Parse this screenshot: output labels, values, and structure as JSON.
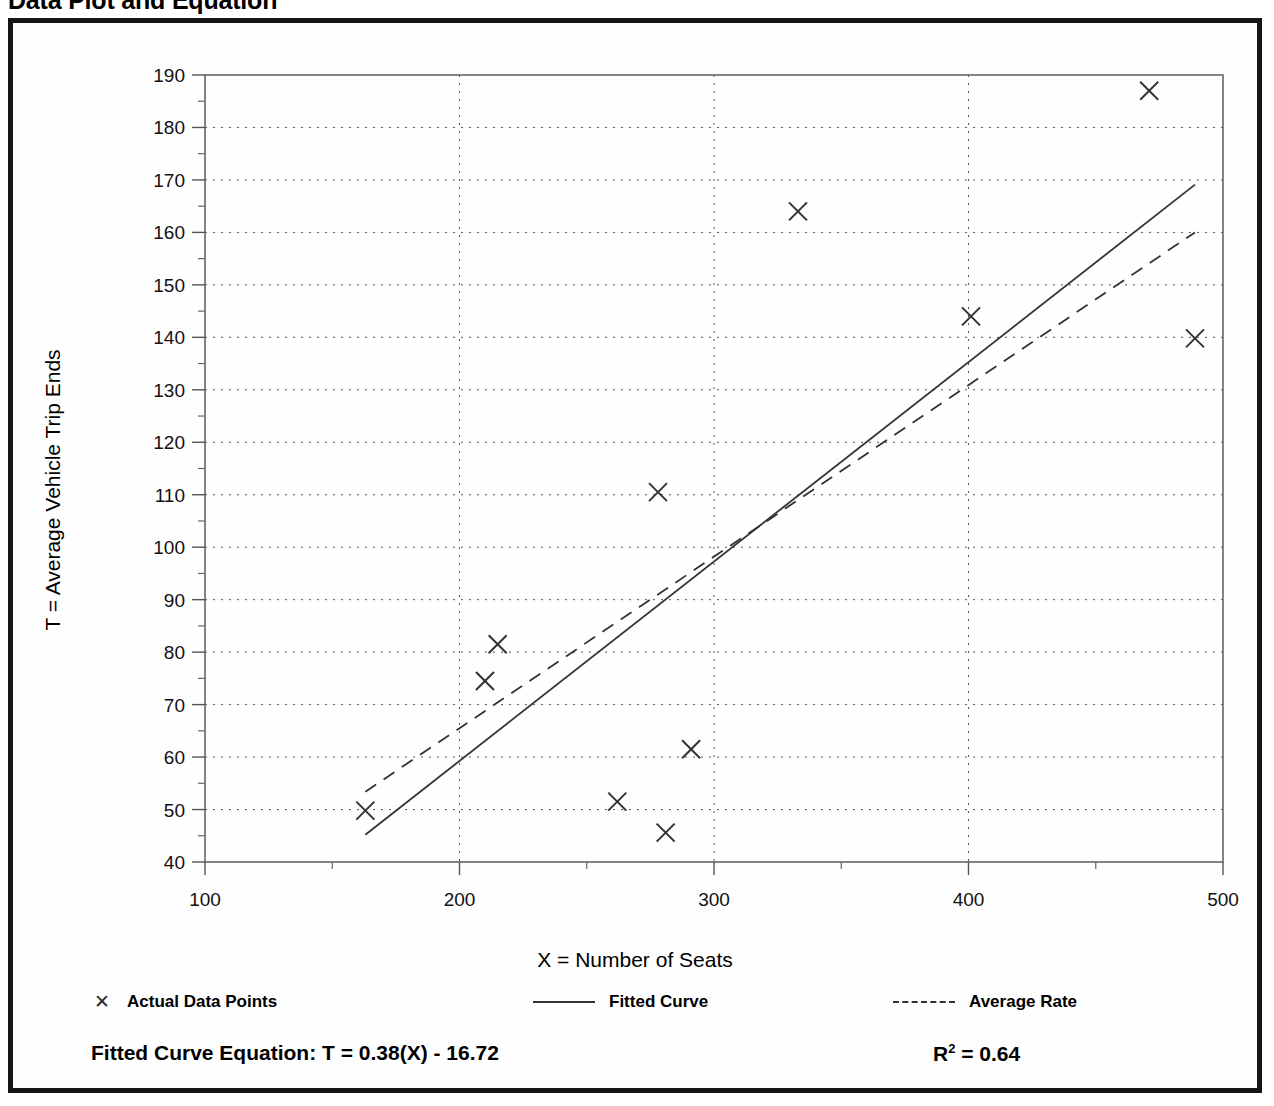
{
  "page": {
    "title": "Data Plot and Equation"
  },
  "legend": {
    "points": {
      "label": "Actual Data Points",
      "marker": "✕"
    },
    "fitted": {
      "label": "Fitted Curve"
    },
    "average": {
      "label": "Average Rate"
    }
  },
  "footer": {
    "equation_label": "Fitted Curve Equation:",
    "equation_value": "T = 0.38(X) - 16.72",
    "equation_full": "Fitted Curve Equation:  T = 0.38(X) - 16.72",
    "r_symbol": "R",
    "r_exponent": "2",
    "r_value": "= 0.64",
    "r_squared_full": "R2 = 0.64"
  },
  "chart_data": {
    "type": "scatter",
    "title": "Data Plot and Equation",
    "xlabel": "X = Number of Seats",
    "ylabel": "T = Average Vehicle Trip Ends",
    "xlim": [
      100,
      500
    ],
    "ylim": [
      40,
      190
    ],
    "xticks": [
      100,
      200,
      300,
      400,
      500
    ],
    "yticks": [
      40,
      50,
      60,
      70,
      80,
      90,
      100,
      110,
      120,
      130,
      140,
      150,
      160,
      170,
      180,
      190
    ],
    "xtick_labels": [
      "100",
      "200",
      "300",
      "400",
      "500"
    ],
    "ytick_labels": [
      "40",
      "50",
      "60",
      "70",
      "80",
      "90",
      "100",
      "110",
      "120",
      "130",
      "140",
      "150",
      "160",
      "170",
      "180",
      "190"
    ],
    "x_minor_step": 50,
    "y_minor_step": 5,
    "grid": true,
    "grid_style": "dotted",
    "legend_position": "below-axes",
    "marker": "x",
    "marker_color": "#333333",
    "points": [
      {
        "x": 163,
        "y": 49.8
      },
      {
        "x": 210,
        "y": 74.5
      },
      {
        "x": 215,
        "y": 81.5
      },
      {
        "x": 262,
        "y": 51.5
      },
      {
        "x": 278,
        "y": 110.5
      },
      {
        "x": 281,
        "y": 45.6
      },
      {
        "x": 291,
        "y": 61.5
      },
      {
        "x": 333,
        "y": 164.0
      },
      {
        "x": 401,
        "y": 144.0
      },
      {
        "x": 471,
        "y": 187.0
      },
      {
        "x": 489,
        "y": 139.8
      }
    ],
    "series": [
      {
        "name": "Fitted Curve",
        "type": "line",
        "style": "solid",
        "color": "#333333",
        "equation": "T = 0.38(X) - 16.72",
        "slope": 0.38,
        "intercept": -16.72,
        "r_squared": 0.64,
        "x_range": [
          163,
          489
        ],
        "endpoints": [
          {
            "x": 163,
            "y": 45.2
          },
          {
            "x": 489,
            "y": 169.1
          }
        ]
      },
      {
        "name": "Average Rate",
        "type": "line",
        "style": "dashed",
        "color": "#333333",
        "slope": 0.328,
        "intercept": 0.0,
        "x_range": [
          163,
          489
        ],
        "endpoints": [
          {
            "x": 163,
            "y": 53.4
          },
          {
            "x": 489,
            "y": 160.0
          }
        ]
      }
    ]
  }
}
